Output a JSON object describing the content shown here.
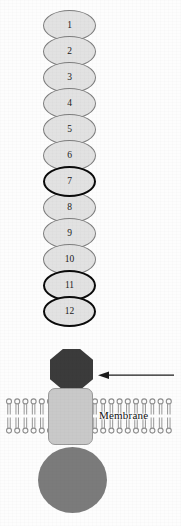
{
  "figure": {
    "background_color": "#fdfdfd"
  },
  "chart_data": {
    "type": "diagram",
    "labels": [
      "Membrane"
    ],
    "annotations": [
      "arrow pointing left toward the juxtamembrane stalk"
    ]
  },
  "repeats": {
    "label_note": "numbered extracellular repeat domains",
    "fill_color": "#e2e2e2",
    "thin_border_color": "#7d7d7d",
    "thick_border_color": "#0a0a0a",
    "items": [
      {
        "number": "1",
        "emphasis": "thin",
        "top": 10
      },
      {
        "number": "2",
        "emphasis": "thin",
        "top": 36
      },
      {
        "number": "3",
        "emphasis": "thin",
        "top": 62
      },
      {
        "number": "4",
        "emphasis": "thin",
        "top": 88
      },
      {
        "number": "5",
        "emphasis": "thin",
        "top": 114
      },
      {
        "number": "6",
        "emphasis": "thin",
        "top": 140
      },
      {
        "number": "7",
        "emphasis": "thick",
        "top": 166
      },
      {
        "number": "8",
        "emphasis": "thin",
        "top": 192
      },
      {
        "number": "9",
        "emphasis": "thin",
        "top": 218
      },
      {
        "number": "10",
        "emphasis": "thin",
        "top": 244
      },
      {
        "number": "11",
        "emphasis": "thick",
        "top": 270
      },
      {
        "number": "12",
        "emphasis": "thick",
        "top": 296
      }
    ]
  },
  "stalk": {
    "name": "octagon-linker",
    "color": "#3b3b3b"
  },
  "transmembrane": {
    "name": "transmembrane-domain",
    "color": "#c9c9c9"
  },
  "cytoplasmic": {
    "name": "cytoplasmic-domain",
    "color": "#7b7b7b"
  },
  "membrane": {
    "label": "Membrane",
    "head_color": "#8e8e8e",
    "tail_color": "#9b9b9b",
    "left_lipid_count": 9,
    "right_lipid_count": 12
  },
  "arrow": {
    "direction": "left",
    "color": "#1c1c1c"
  }
}
